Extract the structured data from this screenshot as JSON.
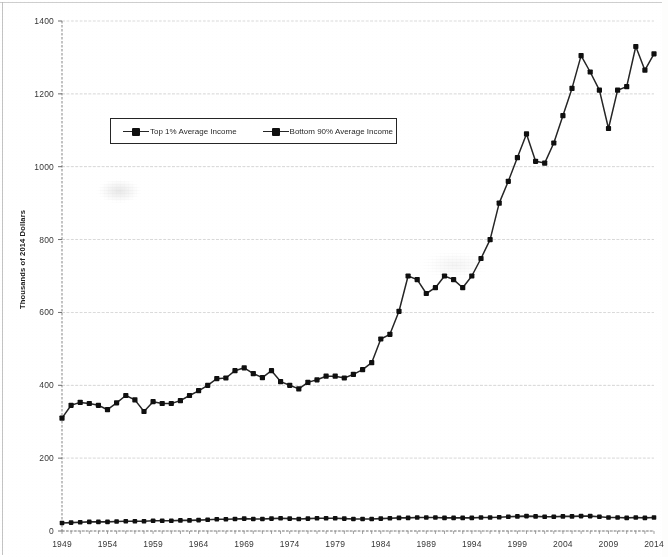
{
  "chart_data": {
    "type": "line",
    "title": "",
    "subtitle": "",
    "xlabel": "",
    "ylabel": "Thousands of 2014 Dollars",
    "ylim": [
      0,
      1400
    ],
    "xlim": [
      1949,
      2014
    ],
    "y_ticks": [
      "0",
      "200",
      "400",
      "600",
      "800",
      "1000",
      "1200",
      "1400"
    ],
    "y_tick_values": [
      0,
      200,
      400,
      600,
      800,
      1000,
      1200,
      1400
    ],
    "x_ticks": [
      "1949",
      "1954",
      "1959",
      "1964",
      "1969",
      "1974",
      "1979",
      "1984",
      "1989",
      "1994",
      "1999",
      "2004",
      "2009",
      "2014"
    ],
    "x_tick_values": [
      1949,
      1954,
      1959,
      1964,
      1969,
      1974,
      1979,
      1984,
      1989,
      1994,
      1999,
      2004,
      2009,
      2014
    ],
    "grid": "horizontal",
    "legend_position": "upper-left-inside",
    "marker": "square",
    "line_color": "#2b2b2b",
    "marker_color": "#161616",
    "x": [
      1949,
      1950,
      1951,
      1952,
      1953,
      1954,
      1955,
      1956,
      1957,
      1958,
      1959,
      1960,
      1961,
      1962,
      1963,
      1964,
      1965,
      1966,
      1967,
      1968,
      1969,
      1970,
      1971,
      1972,
      1973,
      1974,
      1975,
      1976,
      1977,
      1978,
      1979,
      1980,
      1981,
      1982,
      1983,
      1984,
      1985,
      1986,
      1987,
      1988,
      1989,
      1990,
      1991,
      1992,
      1993,
      1994,
      1995,
      1996,
      1997,
      1998,
      1999,
      2000,
      2001,
      2002,
      2003,
      2004,
      2005,
      2006,
      2007,
      2008,
      2009,
      2010,
      2011,
      2012,
      2013,
      2014
    ],
    "series": [
      {
        "name": "Top 1% Average Income",
        "values": [
          310,
          345,
          353,
          350,
          345,
          333,
          352,
          372,
          360,
          328,
          355,
          350,
          350,
          358,
          372,
          385,
          400,
          418,
          420,
          440,
          448,
          432,
          421,
          440,
          410,
          400,
          390,
          408,
          415,
          425,
          425,
          420,
          430,
          443,
          462,
          527,
          540,
          603,
          700,
          690,
          652,
          668,
          700,
          690,
          668,
          700,
          748,
          800,
          900,
          960,
          1025,
          1090,
          1015,
          1010,
          1065,
          1140,
          1215,
          1305,
          1260,
          1210,
          1105,
          1210,
          1220,
          1330,
          1265,
          1310
        ]
      },
      {
        "name": "Bottom 90% Average Income",
        "values": [
          22,
          23,
          24,
          25,
          25,
          25,
          26,
          27,
          27,
          27,
          28,
          28,
          28,
          29,
          29,
          30,
          31,
          32,
          32,
          33,
          34,
          33,
          33,
          34,
          35,
          34,
          33,
          34,
          35,
          35,
          35,
          34,
          33,
          33,
          33,
          34,
          35,
          36,
          36,
          37,
          37,
          37,
          36,
          36,
          36,
          36,
          37,
          37,
          38,
          39,
          40,
          41,
          40,
          39,
          39,
          40,
          40,
          41,
          41,
          39,
          37,
          37,
          36,
          37,
          36,
          37
        ]
      }
    ]
  },
  "legend": {
    "entries": [
      {
        "label": "Top 1% Average Income"
      },
      {
        "label": "Bottom 90% Average Income"
      }
    ]
  }
}
